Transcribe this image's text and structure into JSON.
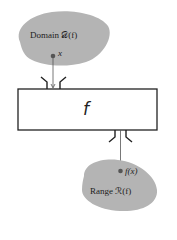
{
  "diagram": {
    "domain": {
      "label": "Domain",
      "symbol": "𝒟(f)",
      "point_label": "x",
      "fill": "#b4b4b4"
    },
    "function_box": {
      "label": "f"
    },
    "range": {
      "label": "Range",
      "symbol": "ℛ(f)",
      "point_label": "f(x)",
      "fill": "#b4b4b4"
    }
  }
}
